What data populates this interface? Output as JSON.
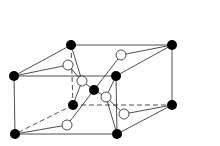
{
  "diagram": {
    "type": "crystal-unit-cell",
    "colors": {
      "background": "#ffffff",
      "line": "#222222",
      "black_atom": "#000000",
      "white_atom": "#ffffff"
    },
    "black_atoms": [
      {
        "id": "tbl",
        "x": 71,
        "y": 45
      },
      {
        "id": "tbr",
        "x": 172,
        "y": 45
      },
      {
        "id": "tfl",
        "x": 14,
        "y": 76
      },
      {
        "id": "tfr",
        "x": 116,
        "y": 76
      },
      {
        "id": "center",
        "x": 94,
        "y": 90
      },
      {
        "id": "bbl",
        "x": 73,
        "y": 105
      },
      {
        "id": "bbr",
        "x": 172,
        "y": 105
      },
      {
        "id": "bfl",
        "x": 15,
        "y": 134
      },
      {
        "id": "bfr",
        "x": 117,
        "y": 134
      }
    ],
    "white_atoms": [
      {
        "id": "w1",
        "x": 68,
        "y": 65
      },
      {
        "id": "w2",
        "x": 82,
        "y": 81
      },
      {
        "id": "w3",
        "x": 121,
        "y": 55
      },
      {
        "id": "w4",
        "x": 106,
        "y": 97
      },
      {
        "id": "w5",
        "x": 124,
        "y": 114
      },
      {
        "id": "w6",
        "x": 67,
        "y": 125
      }
    ]
  }
}
